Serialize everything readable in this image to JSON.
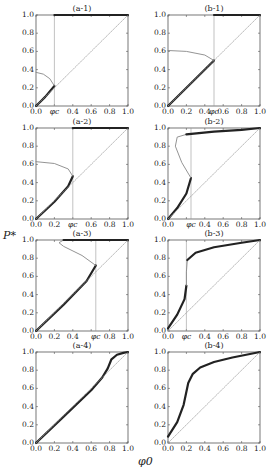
{
  "figure": {
    "y_axis_label": "P*",
    "x_axis_label": "φ0"
  },
  "chart_data": [
    {
      "id": "a-1",
      "type": "line",
      "title": "(a-1)",
      "xlim": [
        0,
        1
      ],
      "ylim": [
        0,
        1
      ],
      "xticks": [
        "0.0",
        "φc",
        "0.4",
        "0.6",
        "0.8",
        "1.0"
      ],
      "yticks": [
        "0.0",
        "0.2",
        "0.4",
        "0.6",
        "0.8",
        "1.0"
      ],
      "critical_phi": 0.2,
      "series": [
        {
          "name": "stable-lower",
          "style": "thick",
          "x": [
            0,
            0.05,
            0.1,
            0.15,
            0.2
          ],
          "y": [
            0,
            0.05,
            0.1,
            0.16,
            0.22
          ]
        },
        {
          "name": "unstable",
          "style": "thin",
          "x": [
            0,
            0.08,
            0.15,
            0.2
          ],
          "y": [
            0.37,
            0.35,
            0.3,
            0.22
          ]
        },
        {
          "name": "stable-upper",
          "style": "thick",
          "x": [
            0.2,
            1.0
          ],
          "y": [
            1.0,
            1.0
          ]
        },
        {
          "name": "diagonal",
          "style": "dotted",
          "x": [
            0,
            1
          ],
          "y": [
            0,
            1
          ]
        }
      ]
    },
    {
      "id": "b-1",
      "type": "line",
      "title": "(b-1)",
      "xlim": [
        0,
        1
      ],
      "ylim": [
        0,
        1
      ],
      "xticks": [
        "0.0",
        "0.2",
        "0.4",
        "φc",
        "0.6",
        "0.8",
        "1.0"
      ],
      "yticks": [
        "0.0",
        "0.2",
        "0.4",
        "0.6",
        "0.8",
        "1.0"
      ],
      "critical_phi": 0.5,
      "series": [
        {
          "name": "stable-lower",
          "style": "thick",
          "x": [
            0,
            0.25,
            0.5
          ],
          "y": [
            0,
            0.25,
            0.5
          ]
        },
        {
          "name": "unstable",
          "style": "thin",
          "x": [
            0,
            0.2,
            0.4,
            0.5
          ],
          "y": [
            0.61,
            0.6,
            0.56,
            0.5
          ]
        },
        {
          "name": "stable-upper",
          "style": "thick",
          "x": [
            0.5,
            1.0
          ],
          "y": [
            1.0,
            1.0
          ]
        },
        {
          "name": "diagonal",
          "style": "dotted",
          "x": [
            0,
            1
          ],
          "y": [
            0,
            1
          ]
        }
      ]
    },
    {
      "id": "a-2",
      "type": "line",
      "title": "(a-2)",
      "xlim": [
        0,
        1
      ],
      "ylim": [
        0,
        1
      ],
      "xticks": [
        "0.0",
        "0.2",
        "φc",
        "0.6",
        "0.8",
        "1.0"
      ],
      "yticks": [
        "0.0",
        "0.2",
        "0.4",
        "0.6",
        "0.8",
        "1.0"
      ],
      "critical_phi": 0.4,
      "series": [
        {
          "name": "stable-lower",
          "style": "thick",
          "x": [
            0,
            0.2,
            0.35,
            0.4
          ],
          "y": [
            0,
            0.19,
            0.36,
            0.47
          ]
        },
        {
          "name": "unstable",
          "style": "thin",
          "x": [
            0,
            0.2,
            0.35,
            0.4
          ],
          "y": [
            0.63,
            0.61,
            0.55,
            0.47
          ]
        },
        {
          "name": "stable-upper",
          "style": "thick",
          "x": [
            0.4,
            1.0
          ],
          "y": [
            1.0,
            1.0
          ]
        },
        {
          "name": "diagonal",
          "style": "dotted",
          "x": [
            0,
            1
          ],
          "y": [
            0,
            1
          ]
        }
      ]
    },
    {
      "id": "b-2",
      "type": "line",
      "title": "(b-2)",
      "xlim": [
        0,
        1
      ],
      "ylim": [
        0,
        1
      ],
      "xticks": [
        "0.0",
        "φc",
        "0.4",
        "0.6",
        "0.8",
        "1.0"
      ],
      "yticks": [
        "0.0",
        "0.2",
        "0.4",
        "0.6",
        "0.8",
        "1.0"
      ],
      "critical_phi": 0.25,
      "series": [
        {
          "name": "stable-lower",
          "style": "thick",
          "x": [
            0,
            0.1,
            0.2,
            0.25
          ],
          "y": [
            0,
            0.12,
            0.28,
            0.45
          ]
        },
        {
          "name": "unstable",
          "style": "thin",
          "x": [
            0.25,
            0.15,
            0.08,
            0.1,
            0.2
          ],
          "y": [
            0.45,
            0.62,
            0.8,
            0.9,
            0.93
          ]
        },
        {
          "name": "stable-upper",
          "style": "thick",
          "x": [
            0.2,
            0.5,
            0.8,
            1.0
          ],
          "y": [
            0.93,
            0.96,
            0.98,
            1.0
          ]
        },
        {
          "name": "diagonal",
          "style": "dotted",
          "x": [
            0,
            1
          ],
          "y": [
            0,
            1
          ]
        }
      ]
    },
    {
      "id": "a-3",
      "type": "line",
      "title": "(a-3)",
      "xlim": [
        0,
        1
      ],
      "ylim": [
        0,
        1
      ],
      "xticks": [
        "0.0",
        "0.2",
        "0.4",
        "φc",
        "0.8",
        "1.0"
      ],
      "yticks": [
        "0.0",
        "0.2",
        "0.4",
        "0.6",
        "0.8",
        "1.0"
      ],
      "critical_phi": 0.65,
      "series": [
        {
          "name": "stable-lower",
          "style": "thick",
          "x": [
            0,
            0.3,
            0.55,
            0.65
          ],
          "y": [
            0,
            0.29,
            0.55,
            0.72
          ]
        },
        {
          "name": "unstable",
          "style": "thin",
          "x": [
            0.65,
            0.5,
            0.3,
            0.25,
            0.3
          ],
          "y": [
            0.72,
            0.83,
            0.93,
            0.97,
            1.0
          ]
        },
        {
          "name": "stable-upper",
          "style": "thick",
          "x": [
            0.3,
            1.0
          ],
          "y": [
            1.0,
            1.0
          ]
        },
        {
          "name": "diagonal",
          "style": "dotted",
          "x": [
            0,
            1
          ],
          "y": [
            0,
            1
          ]
        }
      ]
    },
    {
      "id": "b-3",
      "type": "line",
      "title": "(b-3)",
      "xlim": [
        0,
        1
      ],
      "ylim": [
        0,
        1
      ],
      "xticks": [
        "0.0",
        "φc",
        "0.4",
        "0.6",
        "0.8",
        "1.0"
      ],
      "yticks": [
        "0.0",
        "0.2",
        "0.4",
        "0.6",
        "0.8",
        "1.0"
      ],
      "critical_phi": 0.2,
      "series": [
        {
          "name": "stable-lower",
          "style": "thick",
          "x": [
            0,
            0.1,
            0.18,
            0.2
          ],
          "y": [
            0.03,
            0.18,
            0.35,
            0.5
          ]
        },
        {
          "name": "unstable",
          "style": "thin",
          "x": [
            0.2,
            0.2,
            0.21
          ],
          "y": [
            0.5,
            0.65,
            0.78
          ]
        },
        {
          "name": "stable-upper",
          "style": "thick",
          "x": [
            0.21,
            0.3,
            0.5,
            0.8,
            1.0
          ],
          "y": [
            0.78,
            0.86,
            0.92,
            0.97,
            1.0
          ]
        },
        {
          "name": "diagonal",
          "style": "dotted",
          "x": [
            0,
            1
          ],
          "y": [
            0,
            1
          ]
        }
      ]
    },
    {
      "id": "a-4",
      "type": "line",
      "title": "(a-4)",
      "xlim": [
        0,
        1
      ],
      "ylim": [
        0,
        1
      ],
      "xticks": [
        "0.0",
        "0.2",
        "0.4",
        "0.6",
        "0.8",
        "1.0"
      ],
      "yticks": [
        "0.0",
        "0.2",
        "0.4",
        "0.6",
        "0.8",
        "1.0"
      ],
      "series": [
        {
          "name": "solution",
          "style": "thick",
          "x": [
            0,
            0.3,
            0.6,
            0.72,
            0.78,
            0.82,
            0.88,
            0.95,
            1.0
          ],
          "y": [
            0,
            0.29,
            0.58,
            0.72,
            0.82,
            0.92,
            0.97,
            0.99,
            1.0
          ]
        },
        {
          "name": "diagonal",
          "style": "dotted",
          "x": [
            0,
            1
          ],
          "y": [
            0,
            1
          ]
        }
      ]
    },
    {
      "id": "b-4",
      "type": "line",
      "title": "(b-4)",
      "xlim": [
        0,
        1
      ],
      "ylim": [
        0,
        1
      ],
      "xticks": [
        "0.0",
        "0.2",
        "0.4",
        "0.6",
        "0.8",
        "1.0"
      ],
      "yticks": [
        "0.0",
        "0.2",
        "0.4",
        "0.6",
        "0.8",
        "1.0"
      ],
      "series": [
        {
          "name": "solution",
          "style": "thick",
          "x": [
            0,
            0.1,
            0.17,
            0.22,
            0.27,
            0.35,
            0.5,
            0.7,
            1.0
          ],
          "y": [
            0.07,
            0.23,
            0.42,
            0.66,
            0.76,
            0.83,
            0.89,
            0.94,
            1.0
          ]
        },
        {
          "name": "diagonal",
          "style": "dotted",
          "x": [
            0,
            1
          ],
          "y": [
            0,
            1
          ]
        }
      ]
    }
  ]
}
